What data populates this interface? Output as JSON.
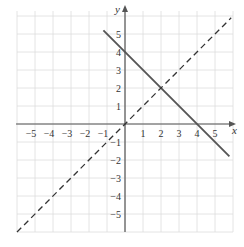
{
  "chart_data": {
    "type": "line",
    "title": "",
    "xlabel": "x",
    "ylabel": "y",
    "xlim": [
      -6,
      6
    ],
    "ylim": [
      -6,
      6.2
    ],
    "grid": true,
    "x_ticks": [
      "−5",
      "−4",
      "−3",
      "−2",
      "−1",
      "1",
      "2",
      "3",
      "4",
      "5"
    ],
    "y_ticks": [
      "5",
      "4",
      "3",
      "2",
      "1",
      "−1",
      "−2",
      "−3",
      "−4",
      "−5"
    ],
    "series": [
      {
        "name": "y = 4 − x",
        "style": "solid",
        "color": "#555555",
        "x": [
          -1.2,
          5.8
        ],
        "y": [
          5.2,
          -1.8
        ]
      },
      {
        "name": "y = x",
        "style": "dashed",
        "color": "#333333",
        "x": [
          -6,
          5.9
        ],
        "y": [
          -6,
          5.9
        ]
      }
    ],
    "annotations": [
      {
        "label": "intersection",
        "x": 2,
        "y": 2
      }
    ]
  },
  "colors": {
    "grid": "#dddddd",
    "axis": "#555555",
    "text": "#333333"
  }
}
